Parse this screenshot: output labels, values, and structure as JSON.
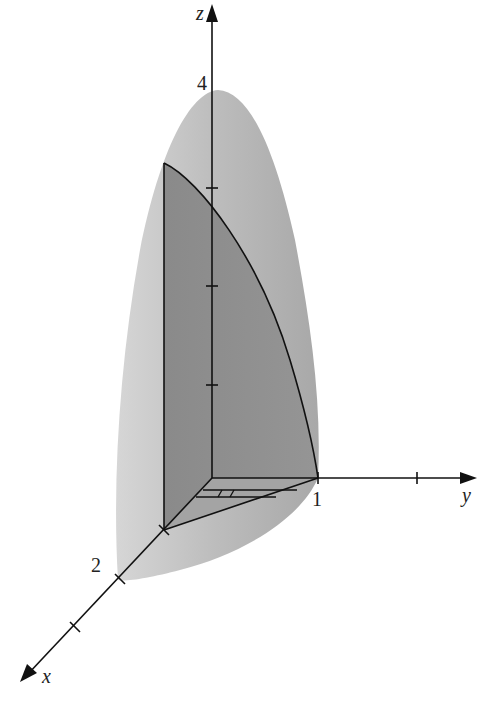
{
  "figure": {
    "colors": {
      "background": "#ffffff",
      "outer_surface": "#bdbdbd",
      "outer_surface_light": "#d2d2d2",
      "inner_solid": "#8e8e8e",
      "inner_base": "#a6a6a6",
      "axis": "#1a1a1a"
    }
  },
  "axes": {
    "x": {
      "label": "x",
      "tick_label": "2"
    },
    "y": {
      "label": "y",
      "tick_label": "1"
    },
    "z": {
      "label": "z",
      "tick_label": "4"
    }
  }
}
